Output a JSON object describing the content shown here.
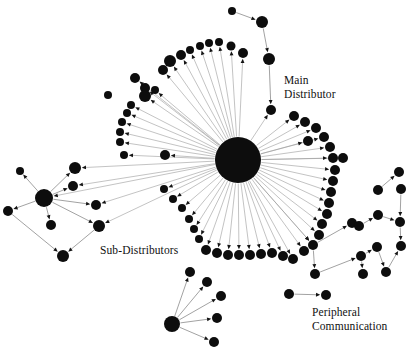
{
  "figure": {
    "type": "network-graph",
    "background_color": "#ffffff",
    "node_color": "#0d0d0d",
    "edge_color": "#9a9a9a",
    "label_color": "#111111",
    "width": 415,
    "height": 353
  },
  "labels": [
    {
      "id": "main-distributor",
      "text_line1": "Main",
      "text_line2": "Distributor",
      "x": 284,
      "y": 84,
      "anchor": "start"
    },
    {
      "id": "sub-distributors",
      "text_line1": "Sub-Distributors",
      "text_line2": "",
      "x": 100,
      "y": 254,
      "anchor": "start"
    },
    {
      "id": "peripheral-communication",
      "text_line1": "Peripheral",
      "text_line2": "Communication",
      "x": 312,
      "y": 316,
      "anchor": "start"
    }
  ],
  "chart_data": {
    "type": "scatter",
    "title": "",
    "xlabel": "",
    "ylabel": "",
    "hubs": [
      {
        "name": "main-distributor-hub",
        "x": 238,
        "y": 160,
        "r": 23
      },
      {
        "name": "sub-distributor-hub",
        "x": 44,
        "y": 198,
        "r": 9
      },
      {
        "name": "lower-hub",
        "x": 172,
        "y": 324,
        "r": 8
      },
      {
        "name": "right-hub",
        "x": 327,
        "y": 243,
        "r": 7
      }
    ],
    "nodes": [
      {
        "id": "n0",
        "x": 238,
        "y": 160,
        "r": 23
      },
      {
        "id": "n1",
        "x": 232,
        "y": 11,
        "r": 4
      },
      {
        "id": "n2",
        "x": 262,
        "y": 22,
        "r": 6
      },
      {
        "id": "n3",
        "x": 269,
        "y": 59,
        "r": 6
      },
      {
        "id": "n4",
        "x": 271,
        "y": 110,
        "r": 5
      },
      {
        "id": "n5",
        "x": 243,
        "y": 53,
        "r": 5
      },
      {
        "id": "n6",
        "x": 231,
        "y": 46,
        "r": 4.5
      },
      {
        "id": "n7",
        "x": 219,
        "y": 42,
        "r": 4
      },
      {
        "id": "n8",
        "x": 209,
        "y": 43,
        "r": 4
      },
      {
        "id": "n9",
        "x": 200,
        "y": 46,
        "r": 4
      },
      {
        "id": "n10",
        "x": 190,
        "y": 50,
        "r": 4
      },
      {
        "id": "n11",
        "x": 181,
        "y": 55,
        "r": 5
      },
      {
        "id": "n12",
        "x": 163,
        "y": 70,
        "r": 5
      },
      {
        "id": "n13",
        "x": 155,
        "y": 90,
        "r": 4
      },
      {
        "id": "n14",
        "x": 145,
        "y": 88,
        "r": 5
      },
      {
        "id": "n15",
        "x": 135,
        "y": 78,
        "r": 5
      },
      {
        "id": "n16",
        "x": 145,
        "y": 96,
        "r": 6
      },
      {
        "id": "n17",
        "x": 131,
        "y": 105,
        "r": 4
      },
      {
        "id": "n18",
        "x": 127,
        "y": 113,
        "r": 4
      },
      {
        "id": "n19",
        "x": 122,
        "y": 122,
        "r": 4
      },
      {
        "id": "n20",
        "x": 120,
        "y": 132,
        "r": 4
      },
      {
        "id": "n21",
        "x": 120,
        "y": 142,
        "r": 4
      },
      {
        "id": "n22",
        "x": 124,
        "y": 155,
        "r": 4
      },
      {
        "id": "n23",
        "x": 170,
        "y": 61,
        "r": 6
      },
      {
        "id": "n24",
        "x": 108,
        "y": 95,
        "r": 4
      },
      {
        "id": "n25",
        "x": 164,
        "y": 189,
        "r": 4
      },
      {
        "id": "n26",
        "x": 173,
        "y": 199,
        "r": 4
      },
      {
        "id": "n27",
        "x": 182,
        "y": 208,
        "r": 4
      },
      {
        "id": "n28",
        "x": 189,
        "y": 219,
        "r": 4
      },
      {
        "id": "n29",
        "x": 194,
        "y": 229,
        "r": 4
      },
      {
        "id": "n30",
        "x": 199,
        "y": 239,
        "r": 4
      },
      {
        "id": "n31",
        "x": 206,
        "y": 250,
        "r": 5
      },
      {
        "id": "n32",
        "x": 217,
        "y": 253,
        "r": 5
      },
      {
        "id": "n33",
        "x": 228,
        "y": 255,
        "r": 5
      },
      {
        "id": "n34",
        "x": 239,
        "y": 255,
        "r": 5
      },
      {
        "id": "n35",
        "x": 250,
        "y": 255,
        "r": 5
      },
      {
        "id": "n36",
        "x": 261,
        "y": 254,
        "r": 5
      },
      {
        "id": "n37",
        "x": 272,
        "y": 253,
        "r": 5
      },
      {
        "id": "n38",
        "x": 283,
        "y": 256,
        "r": 5
      },
      {
        "id": "n39",
        "x": 293,
        "y": 259,
        "r": 5
      },
      {
        "id": "n40",
        "x": 304,
        "y": 251,
        "r": 5
      },
      {
        "id": "n41",
        "x": 313,
        "y": 245,
        "r": 5
      },
      {
        "id": "n42",
        "x": 319,
        "y": 235,
        "r": 5
      },
      {
        "id": "n43",
        "x": 322,
        "y": 224,
        "r": 5
      },
      {
        "id": "n44",
        "x": 327,
        "y": 214,
        "r": 5
      },
      {
        "id": "n45",
        "x": 329,
        "y": 203,
        "r": 5
      },
      {
        "id": "n46",
        "x": 331,
        "y": 192,
        "r": 5
      },
      {
        "id": "n47",
        "x": 333,
        "y": 181,
        "r": 5
      },
      {
        "id": "n48",
        "x": 335,
        "y": 170,
        "r": 5
      },
      {
        "id": "n49",
        "x": 333,
        "y": 158,
        "r": 5
      },
      {
        "id": "n50",
        "x": 330,
        "y": 147,
        "r": 5
      },
      {
        "id": "n51",
        "x": 324,
        "y": 137,
        "r": 5
      },
      {
        "id": "n52",
        "x": 316,
        "y": 128,
        "r": 5
      },
      {
        "id": "n53",
        "x": 305,
        "y": 122,
        "r": 5
      },
      {
        "id": "n54",
        "x": 294,
        "y": 116,
        "r": 5
      },
      {
        "id": "n55",
        "x": 308,
        "y": 141,
        "r": 5
      },
      {
        "id": "n56",
        "x": 343,
        "y": 158,
        "r": 5
      },
      {
        "id": "n57",
        "x": 165,
        "y": 155,
        "r": 5
      },
      {
        "id": "n58",
        "x": 75,
        "y": 168,
        "r": 6
      },
      {
        "id": "n59",
        "x": 73,
        "y": 186,
        "r": 5
      },
      {
        "id": "n60",
        "x": 96,
        "y": 205,
        "r": 5
      },
      {
        "id": "n61",
        "x": 99,
        "y": 226,
        "r": 6
      },
      {
        "id": "n62",
        "x": 44,
        "y": 198,
        "r": 9
      },
      {
        "id": "n63",
        "x": 20,
        "y": 171,
        "r": 4
      },
      {
        "id": "n64",
        "x": 8,
        "y": 211,
        "r": 5
      },
      {
        "id": "n65",
        "x": 51,
        "y": 225,
        "r": 5
      },
      {
        "id": "n66",
        "x": 63,
        "y": 256,
        "r": 6
      },
      {
        "id": "n67",
        "x": 172,
        "y": 324,
        "r": 8
      },
      {
        "id": "n68",
        "x": 190,
        "y": 272,
        "r": 5
      },
      {
        "id": "n69",
        "x": 207,
        "y": 282,
        "r": 5
      },
      {
        "id": "n70",
        "x": 221,
        "y": 296,
        "r": 5
      },
      {
        "id": "n71",
        "x": 217,
        "y": 318,
        "r": 5
      },
      {
        "id": "n72",
        "x": 214,
        "y": 342,
        "r": 5
      },
      {
        "id": "n73",
        "x": 361,
        "y": 256,
        "r": 5
      },
      {
        "id": "n74",
        "x": 377,
        "y": 247,
        "r": 5
      },
      {
        "id": "n75",
        "x": 386,
        "y": 272,
        "r": 5
      },
      {
        "id": "n76",
        "x": 363,
        "y": 274,
        "r": 5
      },
      {
        "id": "n77",
        "x": 315,
        "y": 274,
        "r": 5
      },
      {
        "id": "n78",
        "x": 352,
        "y": 223,
        "r": 5
      },
      {
        "id": "n79",
        "x": 378,
        "y": 215,
        "r": 5
      },
      {
        "id": "n80",
        "x": 359,
        "y": 226,
        "r": 5
      },
      {
        "id": "n81",
        "x": 378,
        "y": 190,
        "r": 5
      },
      {
        "id": "n82",
        "x": 401,
        "y": 189,
        "r": 5
      },
      {
        "id": "n83",
        "x": 400,
        "y": 222,
        "r": 5
      },
      {
        "id": "n84",
        "x": 401,
        "y": 246,
        "r": 5
      },
      {
        "id": "n85",
        "x": 399,
        "y": 172,
        "r": 5
      },
      {
        "id": "n86",
        "x": 289,
        "y": 294,
        "r": 5
      },
      {
        "id": "n87",
        "x": 326,
        "y": 295,
        "r": 5
      }
    ],
    "edge_count": 84,
    "node_count": 88
  }
}
